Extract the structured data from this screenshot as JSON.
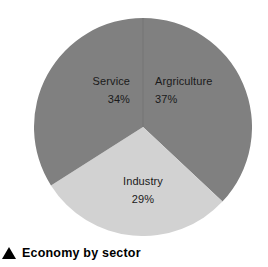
{
  "caption": {
    "marker_icon": "triangle-up-icon",
    "text": "Economy by sector"
  },
  "colors": {
    "slice_dark": "#808080",
    "slice_light": "#d2d2d2",
    "label_text": "#1a1a1a",
    "caption_text": "#000000",
    "background": "#ffffff"
  },
  "chart_data": {
    "type": "pie",
    "title": "Economy by sector",
    "labels": [
      "Argriculture",
      "Industry",
      "Service"
    ],
    "values": [
      37,
      29,
      34
    ],
    "value_suffix": "%",
    "value_labels": [
      "37%",
      "29%",
      "34%"
    ],
    "colors": [
      "#808080",
      "#d2d2d2",
      "#808080"
    ],
    "start_angle_deg": 0,
    "direction": "clockwise",
    "legend": "none",
    "grid": false,
    "slices": [
      {
        "label": "Argriculture",
        "value": 37,
        "value_label": "37%",
        "color": "#808080",
        "position": "right"
      },
      {
        "label": "Industry",
        "value": 29,
        "value_label": "29%",
        "color": "#d2d2d2",
        "position": "bottom"
      },
      {
        "label": "Service",
        "value": 34,
        "value_label": "34%",
        "color": "#808080",
        "position": "left"
      }
    ]
  }
}
